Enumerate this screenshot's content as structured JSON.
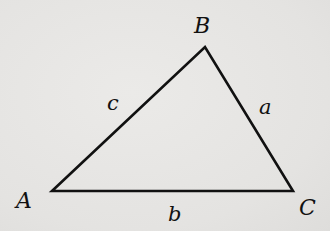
{
  "diagram": {
    "type": "triangle",
    "stroke_color": "#111111",
    "background_color": "#e6e5e3",
    "vertices": [
      {
        "label": "A",
        "x": 52,
        "y": 191
      },
      {
        "label": "B",
        "x": 205,
        "y": 47
      },
      {
        "label": "C",
        "x": 293,
        "y": 191
      }
    ],
    "sides": [
      {
        "label": "a",
        "between": "B-C"
      },
      {
        "label": "b",
        "between": "A-C"
      },
      {
        "label": "c",
        "between": "A-B"
      }
    ],
    "labels": {
      "A": "A",
      "B": "B",
      "C": "C",
      "a": "a",
      "b": "b",
      "c": "c"
    }
  }
}
